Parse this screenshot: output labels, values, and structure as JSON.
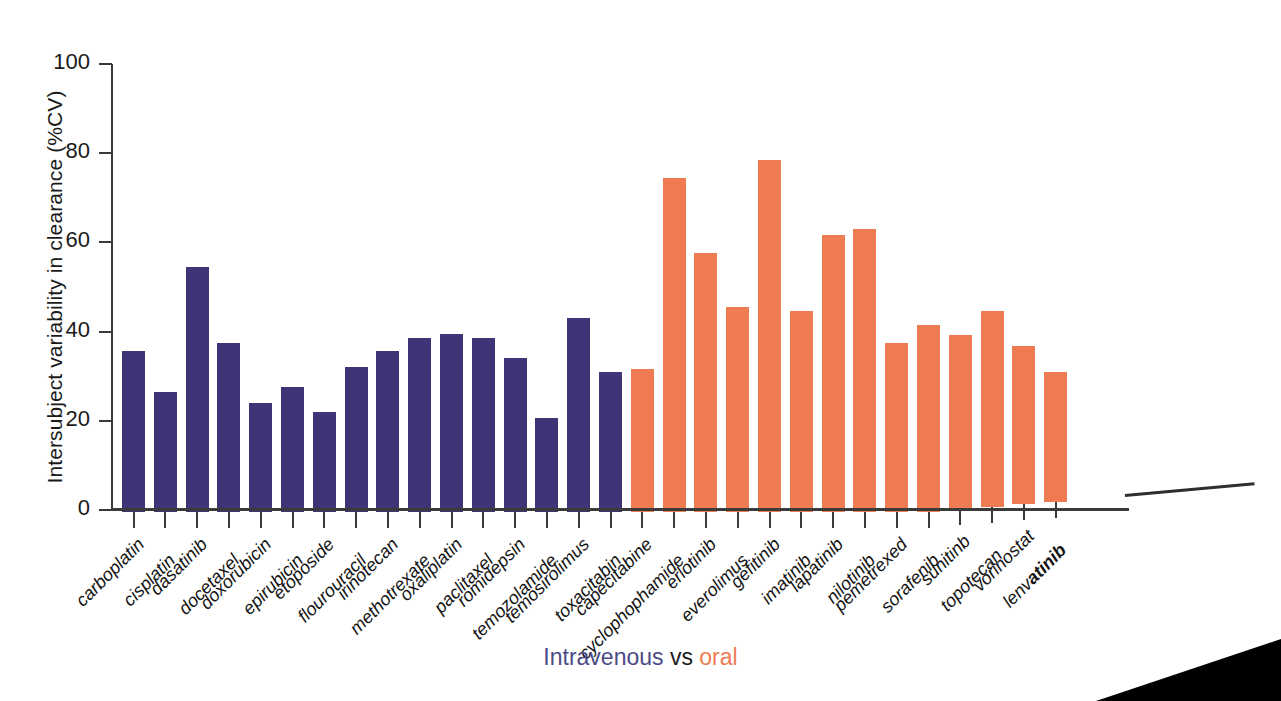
{
  "chart_data": {
    "type": "bar",
    "title": "",
    "xlabel": "Intravenous vs oral",
    "ylabel": "Intersubject variability in clearance (%CV)",
    "ylim": [
      0,
      100
    ],
    "ytick_labels": [
      "0",
      "20",
      "40",
      "60",
      "80",
      "100"
    ],
    "ytick_values": [
      0,
      20,
      40,
      60,
      80,
      100
    ],
    "grid": false,
    "legend_position": "below-axis",
    "categories": [
      "carboplatin",
      "cisplatin",
      "dasatinib",
      "docetaxel",
      "doxorubicin",
      "epirubicin",
      "etoposide",
      "flourouracil",
      "irinotecan",
      "methotrexate",
      "oxaliplatin",
      "paclitaxel",
      "romidepsin",
      "temozolamide",
      "temosirolimus",
      "toxacitabin",
      "capecitabine",
      "cyclophophamide",
      "erlotinib",
      "everolimus",
      "gefitinib",
      "imatinib",
      "lapatinib",
      "nilotinib",
      "pemetrexed",
      "sorafenib",
      "sunitinb",
      "topotecan",
      "vorinostat",
      "lenvatinib"
    ],
    "values": [
      36,
      27,
      55,
      38,
      24.5,
      28,
      22.5,
      32.5,
      36,
      39,
      40,
      39,
      34.5,
      21,
      43.5,
      31.5,
      32,
      75,
      58,
      46,
      79,
      45,
      62,
      63.5,
      38,
      42,
      39,
      44,
      35.5,
      29
    ],
    "groups": [
      "intravenous",
      "intravenous",
      "intravenous",
      "intravenous",
      "intravenous",
      "intravenous",
      "intravenous",
      "intravenous",
      "intravenous",
      "intravenous",
      "intravenous",
      "intravenous",
      "intravenous",
      "intravenous",
      "intravenous",
      "intravenous",
      "oral",
      "oral",
      "oral",
      "oral",
      "oral",
      "oral",
      "oral",
      "oral",
      "oral",
      "oral",
      "oral",
      "oral",
      "oral",
      "oral"
    ],
    "series": [
      {
        "name": "Intravenous",
        "color": "#3e3478"
      },
      {
        "name": "oral",
        "color": "#ef7b52"
      }
    ]
  },
  "caption": {
    "intravenous_word": "Intravenous",
    "vs_word": "vs",
    "oral_word": "oral"
  },
  "colors": {
    "intravenous": "#3e3478",
    "oral": "#ef7b52",
    "axis": "#3a3a3a",
    "text": "#1a1a1a"
  }
}
